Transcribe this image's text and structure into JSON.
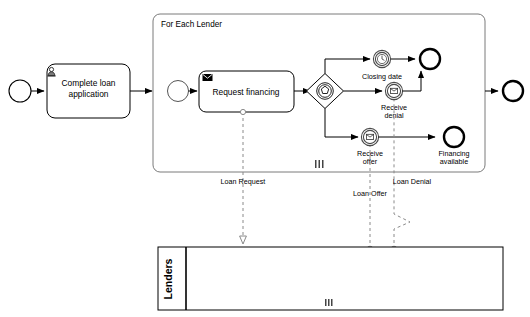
{
  "diagram": {
    "type": "bpmn-collaboration",
    "title_partial": "",
    "subprocess": {
      "label": "For Each Lender",
      "marker": "multi-instance-parallel"
    },
    "tasks": [
      {
        "id": "complete-loan-application",
        "label_line1": "Complete loan",
        "label_line2": "application",
        "icon": "user-icon",
        "type": "user-task"
      },
      {
        "id": "request-financing",
        "label_line1": "Request financing",
        "label_line2": "",
        "icon": "envelope-filled-icon",
        "type": "send-task"
      }
    ],
    "events": [
      {
        "id": "start-event",
        "label": "",
        "type": "start",
        "icon": "none"
      },
      {
        "id": "subprocess-start-event",
        "label": "",
        "type": "start",
        "icon": "none"
      },
      {
        "id": "closing-date",
        "label": "Closing date",
        "type": "intermediate-catch",
        "icon": "timer-icon"
      },
      {
        "id": "receive-denial",
        "label_line1": "Receive",
        "label_line2": "denial",
        "type": "intermediate-catch",
        "icon": "message-icon"
      },
      {
        "id": "receive-offer",
        "label_line1": "Receive",
        "label_line2": "offer",
        "type": "intermediate-catch",
        "icon": "message-icon"
      },
      {
        "id": "no-financing-end",
        "label": "",
        "type": "end",
        "icon": "none"
      },
      {
        "id": "financing-available",
        "label_line1": "Financing",
        "label_line2": "available",
        "type": "end",
        "icon": "none"
      },
      {
        "id": "process-end",
        "label": "",
        "type": "end",
        "icon": "none"
      }
    ],
    "gateways": [
      {
        "id": "event-based-gateway",
        "label": "",
        "type": "event-based"
      }
    ],
    "message_flows": [
      {
        "id": "loan-request",
        "label": "Loan Request",
        "direction": "to-pool"
      },
      {
        "id": "loan-offer",
        "label": "Loan Offer",
        "direction": "from-pool"
      },
      {
        "id": "loan-denial",
        "label": "Loan Denial",
        "direction": "from-pool"
      }
    ],
    "pool": {
      "label": "Lenders",
      "marker": "multi-instance-parallel"
    },
    "colors": {
      "stroke": "#000000",
      "subprocess_border": "#7a7a7a",
      "message_flow": "#8a8a8a",
      "background": "#ffffff"
    }
  }
}
